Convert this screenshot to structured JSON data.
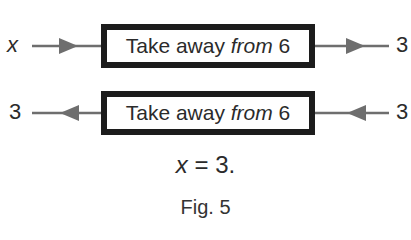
{
  "figure": {
    "caption": "Fig. 5",
    "rows": [
      {
        "direction": "forward",
        "input_label": "x",
        "output_label": "3",
        "box": {
          "prefix": "Take away ",
          "emphasis": "from",
          "suffix": " 6"
        }
      },
      {
        "direction": "reverse",
        "input_label": "3",
        "output_label": "3",
        "box": {
          "prefix": "Take away ",
          "emphasis": "from",
          "suffix": " 6"
        }
      }
    ],
    "equation": {
      "variable": "x",
      "operator": "=",
      "value": "3."
    },
    "colors": {
      "box_border": "#1c1c1c",
      "arrow": "#6e6e6e",
      "text": "#2b2b2b"
    }
  }
}
